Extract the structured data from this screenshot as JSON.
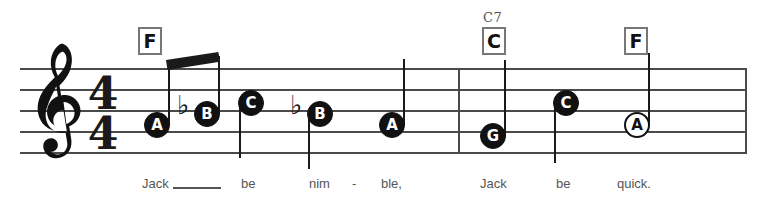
{
  "score": {
    "title": "Jack Be Nimble",
    "clef": "treble-clef",
    "clef_glyph": "𝄞",
    "time_signature": {
      "numerator": "4",
      "denominator": "4"
    },
    "ink_color": "#1a1a1a",
    "staff_color": "#4a4a4a",
    "lyric_color": "#555555",
    "chordbox_border_color": "#777777"
  },
  "chords": [
    {
      "name": "chord-f-1",
      "label": "F",
      "superscript": "",
      "x": 138,
      "y": 27,
      "w": 24,
      "h": 28
    },
    {
      "name": "chord-c7",
      "label": "C",
      "superscript": "C7",
      "x": 482,
      "y": 27,
      "w": 24,
      "h": 28
    },
    {
      "name": "chord-f-2",
      "label": "F",
      "superscript": "",
      "x": 624,
      "y": 27,
      "w": 24,
      "h": 28
    }
  ],
  "staff": {
    "line_count": 5,
    "left": 20,
    "right": 747,
    "top_y": 68,
    "spacing": 21,
    "barlines": [
      {
        "name": "barline-1",
        "x": 458,
        "top": 68,
        "height": 84
      },
      {
        "name": "barline-end",
        "x": 745,
        "top": 68,
        "height": 84
      }
    ]
  },
  "notes": [
    {
      "name": "note-a-1",
      "letter": "A",
      "head": "filled",
      "cx": 157,
      "cy": 125,
      "accidental": "",
      "stem": "up",
      "stem_len": 58,
      "lyric": "Jack"
    },
    {
      "name": "note-b-1",
      "letter": "B",
      "head": "filled",
      "cx": 207,
      "cy": 114,
      "accidental": "flat",
      "stem": "up",
      "stem_len": 58,
      "lyric": ""
    },
    {
      "name": "note-c-1",
      "letter": "C",
      "head": "filled",
      "cx": 251,
      "cy": 103,
      "accidental": "",
      "stem": "down",
      "stem_len": 55,
      "lyric": "be"
    },
    {
      "name": "note-b-2",
      "letter": "B",
      "head": "filled",
      "cx": 320,
      "cy": 114,
      "accidental": "flat",
      "stem": "down",
      "stem_len": 55,
      "lyric": "nim"
    },
    {
      "name": "note-a-2",
      "letter": "A",
      "head": "filled",
      "cx": 392,
      "cy": 125,
      "accidental": "",
      "stem": "up",
      "stem_len": 66,
      "lyric": "ble,"
    },
    {
      "name": "note-g-1",
      "letter": "G",
      "head": "filled",
      "cx": 493,
      "cy": 136,
      "accidental": "",
      "stem": "up",
      "stem_len": 76,
      "lyric": "Jack"
    },
    {
      "name": "note-c-2",
      "letter": "C",
      "head": "filled",
      "cx": 566,
      "cy": 103,
      "accidental": "",
      "stem": "down",
      "stem_len": 60,
      "lyric": "be"
    },
    {
      "name": "note-a-3",
      "letter": "A",
      "head": "hollow",
      "cx": 637,
      "cy": 125,
      "accidental": "",
      "stem": "up",
      "stem_len": 72,
      "lyric": "quick."
    }
  ],
  "beam": {
    "name": "beam-a-b",
    "x1": 166,
    "y1": 60,
    "x2": 218,
    "y2": 52,
    "thickness": 10
  },
  "lyrics": [
    {
      "name": "lyric-jack-1",
      "text": "Jack",
      "x": 142,
      "y": 176
    },
    {
      "name": "lyric-be-1",
      "text": "be",
      "x": 241,
      "y": 176
    },
    {
      "name": "lyric-nim",
      "text": "nim",
      "x": 309,
      "y": 176
    },
    {
      "name": "lyric-hyphen",
      "text": "-",
      "x": 352,
      "y": 176
    },
    {
      "name": "lyric-ble",
      "text": "ble,",
      "x": 381,
      "y": 176
    },
    {
      "name": "lyric-jack-2",
      "text": "Jack",
      "x": 480,
      "y": 176
    },
    {
      "name": "lyric-be-2",
      "text": "be",
      "x": 556,
      "y": 176
    },
    {
      "name": "lyric-quick",
      "text": "quick.",
      "x": 617,
      "y": 176
    }
  ],
  "extender": {
    "name": "lyric-extender",
    "x": 173,
    "y": 187,
    "w": 48
  }
}
